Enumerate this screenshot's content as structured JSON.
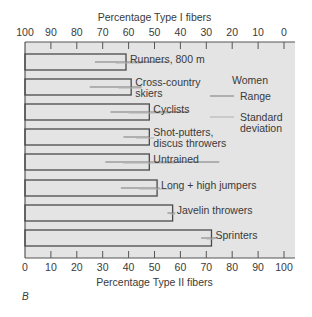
{
  "chart_data": {
    "type": "bar",
    "orientation": "horizontal",
    "top_axis_label": "Percentage Type I fibers",
    "bottom_axis_label": "Percentage Type II fibers",
    "top_ticks": [
      "100",
      "90",
      "80",
      "70",
      "60",
      "50",
      "40",
      "30",
      "20",
      "10",
      "0"
    ],
    "bottom_ticks": [
      "0",
      "10",
      "20",
      "30",
      "40",
      "50",
      "60",
      "70",
      "80",
      "90",
      "100"
    ],
    "xlim": [
      0,
      100
    ],
    "panel_label": "B",
    "legend": {
      "title": "Women",
      "items": [
        {
          "label": "Range",
          "style": "dark line"
        },
        {
          "label": "Standard deviation",
          "style": "light line"
        }
      ]
    },
    "categories": [
      "Runners, 800 m",
      "Cross-country skiers",
      "Cyclists",
      "Shot-putters, discus throwers",
      "Untrained",
      "Long + high jumpers",
      "Javelin throwers",
      "Sprinters"
    ],
    "label_lines": [
      [
        "Runners, 800 m"
      ],
      [
        "Cross-country",
        "skiers"
      ],
      [
        "Cyclists"
      ],
      [
        "Shot-putters,",
        "discus throwers"
      ],
      [
        "Untrained"
      ],
      [
        "Long + high jumpers"
      ],
      [
        "Javelin throwers"
      ],
      [
        "Sprinters"
      ]
    ],
    "values": [
      39,
      41,
      48,
      48,
      48,
      51,
      57,
      72
    ],
    "range": [
      [
        27,
        55
      ],
      [
        25,
        45
      ],
      [
        33,
        63
      ],
      [
        38,
        48
      ],
      [
        31,
        75
      ],
      [
        37,
        52
      ],
      [
        55,
        58
      ],
      [
        68,
        74
      ]
    ],
    "std_dev": [
      [
        35,
        45
      ],
      [
        36,
        45
      ],
      [
        40,
        56
      ],
      [
        43,
        50
      ],
      [
        38,
        58
      ],
      [
        44,
        57
      ],
      [
        56,
        58
      ],
      [
        70,
        73
      ]
    ],
    "colors": {
      "background": "#e4e4e4",
      "bar_edge": "#4a4a4a",
      "range": "#7a7a7a",
      "sd": "#b0b0b0"
    }
  }
}
